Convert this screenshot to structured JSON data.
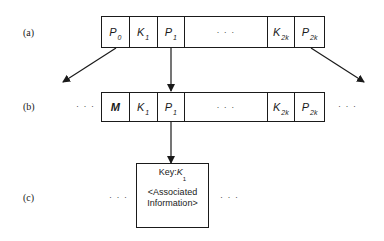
{
  "figure": {
    "rows": [
      {
        "label": "(a)",
        "cells": [
          {
            "main": "P",
            "sub": "0"
          },
          {
            "main": "K",
            "sub": "1"
          },
          {
            "main": "P",
            "sub": "1"
          },
          {
            "main": "· · ·",
            "sub": ""
          },
          {
            "main": "K",
            "sub": "2k"
          },
          {
            "main": "P",
            "sub": "2k"
          }
        ]
      },
      {
        "label": "(b)",
        "left_ellipsis": "· · ·",
        "right_ellipsis": "· · ·",
        "cells": [
          {
            "main": "M",
            "sub": ""
          },
          {
            "main": "K",
            "sub": "1"
          },
          {
            "main": "P",
            "sub": "1"
          },
          {
            "main": "· · ·",
            "sub": ""
          },
          {
            "main": "K",
            "sub": "2k"
          },
          {
            "main": "P",
            "sub": "2k"
          }
        ]
      },
      {
        "label": "(c)",
        "left_ellipsis": "· · ·",
        "right_ellipsis": "· · ·",
        "record": {
          "key_prefix": "Key:",
          "key_main": "K",
          "key_sub": "1",
          "info_line1": "<Associated",
          "info_line2": "Information>"
        }
      }
    ],
    "arrows": [
      {
        "from": "P0 (a)",
        "to": "lower-left"
      },
      {
        "from": "P1 (a)",
        "to": "node (b)"
      },
      {
        "from": "P2k (a)",
        "to": "lower-right"
      },
      {
        "from": "P1 (b)",
        "to": "record (c)"
      }
    ]
  }
}
